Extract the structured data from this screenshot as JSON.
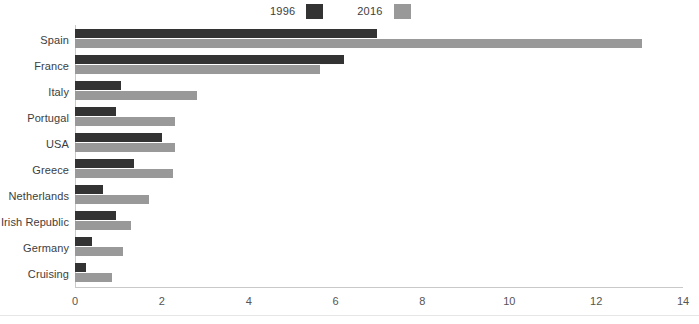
{
  "chart_data": {
    "type": "bar",
    "orientation": "horizontal",
    "title": "",
    "xlabel": "",
    "ylabel": "",
    "categories": [
      "Spain",
      "France",
      "Italy",
      "Portugal",
      "USA",
      "Greece",
      "Netherlands",
      "Irish Republic",
      "Germany",
      "Cruising"
    ],
    "series": [
      {
        "name": "1996",
        "color": "#333333",
        "values": [
          6.95,
          6.2,
          1.05,
          0.95,
          2.0,
          1.35,
          0.65,
          0.95,
          0.4,
          0.25
        ]
      },
      {
        "name": "2016",
        "color": "#999999",
        "values": [
          13.05,
          5.65,
          2.8,
          2.3,
          2.3,
          2.25,
          1.7,
          1.3,
          1.1,
          0.85
        ]
      }
    ],
    "xlim": [
      0,
      14
    ],
    "xticks": [
      0,
      2,
      4,
      6,
      8,
      10,
      12,
      14
    ],
    "xtick_labels": [
      "0",
      "2",
      "4",
      "6",
      "8",
      "10",
      "12",
      "14"
    ],
    "grid": false,
    "legend": {
      "position": "top-center",
      "entries": [
        {
          "label": "1996",
          "color": "#333333"
        },
        {
          "label": "2016",
          "color": "#999999"
        }
      ]
    }
  }
}
